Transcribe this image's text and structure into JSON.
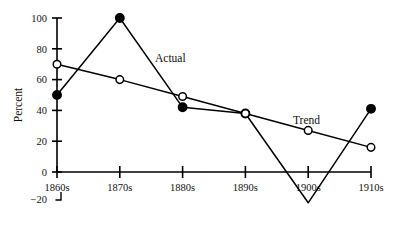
{
  "chart_data": {
    "type": "line",
    "title": "",
    "xlabel": "",
    "ylabel": "Percent",
    "categories": [
      "1860s",
      "1870s",
      "1880s",
      "1890s",
      "1900s",
      "1910s"
    ],
    "ylim": [
      -20,
      100
    ],
    "xlim_categories": [
      "1860s",
      "1910s"
    ],
    "grid": false,
    "legend_position": "inline-annotation",
    "yticks": [
      "0",
      "20",
      "40",
      "60",
      "80",
      "100"
    ],
    "ytick_values": [
      0,
      20,
      40,
      60,
      80,
      100
    ],
    "axis_break_label": "−20",
    "series": [
      {
        "name": "Actual",
        "marker": "filled-circle",
        "values": [
          50,
          100,
          42,
          38,
          -20,
          41
        ]
      },
      {
        "name": "Trend",
        "marker": "hollow-circle",
        "values": [
          70,
          60,
          49,
          38,
          27,
          16
        ]
      }
    ],
    "annotations": [
      {
        "text": "Actual",
        "series": "Actual"
      },
      {
        "text": "Trend",
        "series": "Trend"
      }
    ],
    "colors": {
      "line": "#000000",
      "marker_fill": "#000000",
      "marker_hollow_fill": "#ffffff",
      "axis": "#000000",
      "background": "#ffffff",
      "text": "#111111"
    }
  }
}
